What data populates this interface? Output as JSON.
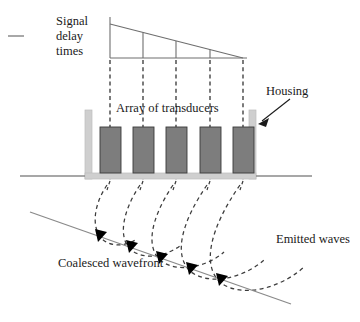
{
  "figure": {
    "labels": {
      "signal_delay_times": "Signal delay times",
      "array_of_transducers": "Array of transducers",
      "housing": "Housing",
      "emitted_waves": "Emitted waves",
      "coalesced_wavefront": "Coalesced wavefront"
    },
    "colors": {
      "line": "#6e6e6e",
      "dashed": "#3c3c3c",
      "transducer_fill": "#7d7d7d",
      "transducer_stroke": "#3a3a3a",
      "housing_fill": "#cfcfcf",
      "housing_stroke": "#b5b5b5",
      "baseline": "#8a8a8a",
      "arrowhead": "#000000",
      "text": "#1a1a1a",
      "background": "#ffffff"
    },
    "delay_graph": {
      "description": "Right triangle showing linearly decreasing signal delay times across the array",
      "axis_x_start": 110,
      "axis_x_end": 243,
      "axis_y": 58,
      "vertical_axis_top": 17,
      "ramp_start_y": 24,
      "ramp_end_y": 58,
      "tick_count": 5,
      "tick_x_positions": [
        110,
        143,
        176,
        210,
        243
      ],
      "tick_top_y": [
        24,
        32.5,
        41,
        49.5,
        58
      ]
    },
    "transducers": {
      "count": 5,
      "x_positions": [
        97,
        130,
        163,
        197,
        230
      ],
      "width": 20,
      "top": 127,
      "height": 46
    },
    "dashed_connectors": {
      "count": 5,
      "x_positions": [
        110,
        143,
        176,
        210,
        243
      ],
      "top": 60,
      "bottom": 180
    },
    "housing": {
      "left_wall_x": 85,
      "right_wall_x": 249,
      "wall_width": 7,
      "top": 110,
      "floor_y": 173,
      "floor_height": 6
    },
    "baseline": {
      "left_segment": [
        20,
        176,
        85,
        176
      ],
      "right_segment": [
        256,
        176,
        312,
        176
      ]
    },
    "wavefront_line": {
      "start": [
        30,
        212
      ],
      "end": [
        290,
        304
      ],
      "description": "Coalesced wavefront, tilted straight line tangent to the emitted wave arcs"
    },
    "arrowheads": {
      "count": 5,
      "positions": [
        [
          100,
          237
        ],
        [
          130,
          248
        ],
        [
          160,
          259
        ],
        [
          190,
          270
        ],
        [
          220,
          281
        ]
      ],
      "description": "Solid black arrowheads marking wave propagation direction along the coalesced wavefront"
    },
    "emitted_wave_arcs": {
      "count": 5,
      "description": "Dashed circular arcs of increasing radius emitted from each transducer, tangent to the coalesced wavefront"
    },
    "left_tick_mark": {
      "position": [
        8,
        36,
        24,
        36
      ],
      "description": "Short horizontal dash at far left margin"
    }
  }
}
